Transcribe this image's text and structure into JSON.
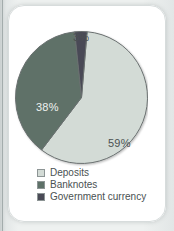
{
  "chart_data": {
    "type": "pie",
    "title": "",
    "subtitle": "",
    "xlabel": "",
    "ylabel": "",
    "grid": false,
    "legend_position": "bottom",
    "units": "percent",
    "categories": [
      "Deposits",
      "Banknotes",
      "Government currency"
    ],
    "values": [
      59,
      38,
      3
    ],
    "slices": [
      {
        "name": "Deposits",
        "value": 59,
        "data_label": "59%",
        "color": "#d3dbd6",
        "label_color": "#4b5152"
      },
      {
        "name": "Banknotes",
        "value": 38,
        "data_label": "38%",
        "color": "#5e7168",
        "label_color": "#eef2f0"
      },
      {
        "name": "Government currency",
        "value": 3,
        "data_label": "3%",
        "color": "#4a4a56",
        "label_color": "#4b5152"
      }
    ],
    "legend": [
      {
        "label": "Deposits",
        "color": "#d3dbd6"
      },
      {
        "label": "Banknotes",
        "color": "#5e7168"
      },
      {
        "label": "Government currency",
        "color": "#4a4a56"
      }
    ],
    "annotations": []
  },
  "colors": {
    "page_background": "#eef1f0",
    "card_background": "#ffffff",
    "outline": "#6a7070",
    "deposits": "#d3dbd6",
    "banknotes": "#5e7168",
    "government_currency": "#4a4a56"
  }
}
